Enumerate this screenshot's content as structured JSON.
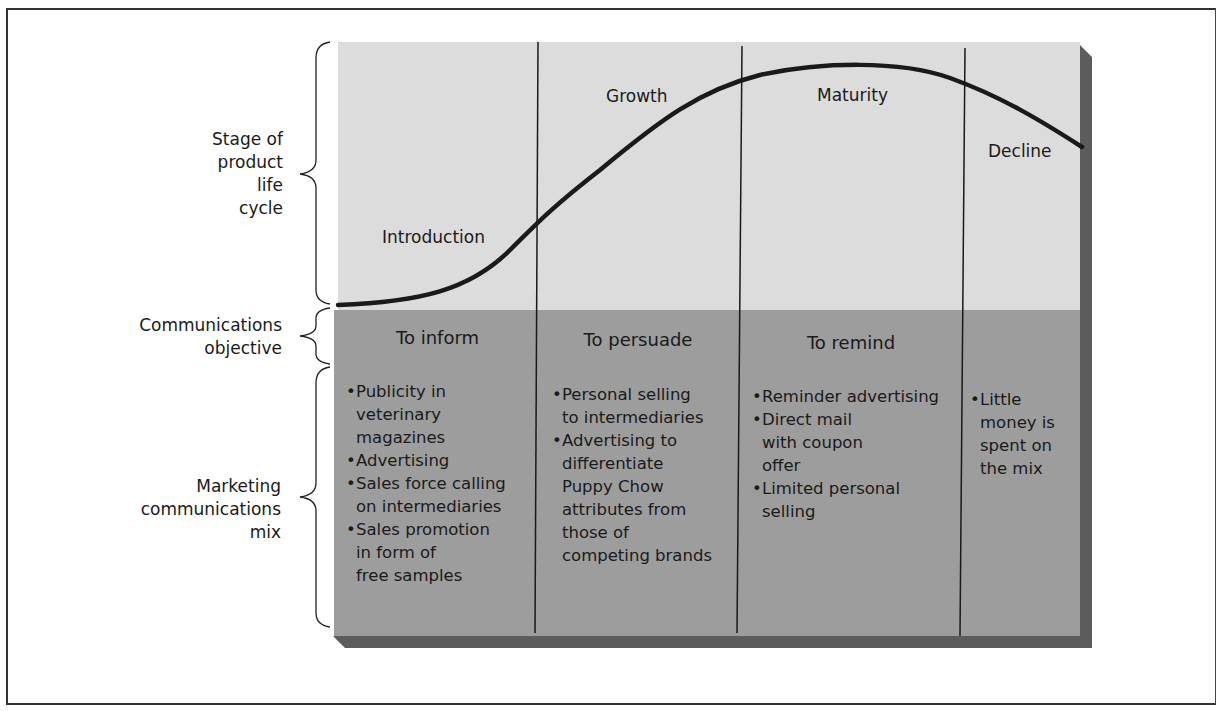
{
  "row_labels": {
    "stage": [
      "Stage of",
      "product",
      "life",
      "cycle"
    ],
    "objective": [
      "Communications",
      "objective"
    ],
    "mix": [
      "Marketing",
      "communications",
      "mix"
    ]
  },
  "stages": [
    {
      "name": "Introduction",
      "objective": "To inform",
      "mix": [
        "Publicity in veterinary magazines",
        "Advertising",
        "Sales force calling on intermediaries",
        "Sales promotion in form of free samples"
      ]
    },
    {
      "name": "Growth",
      "objective": "To persuade",
      "mix": [
        "Personal selling to intermediaries",
        "Advertising to differentiate Puppy Chow attributes from those of competing brands"
      ]
    },
    {
      "name": "Maturity",
      "objective": "To remind",
      "mix": [
        "Reminder advertising",
        "Direct mail with coupon offer",
        "Limited personal selling"
      ]
    },
    {
      "name": "Decline",
      "objective": "",
      "mix": [
        "Little money is spent on the mix"
      ]
    }
  ],
  "mix_lines": {
    "introduction": [
      [
        "Publicity in",
        "veterinary",
        "magazines"
      ],
      [
        "Advertising"
      ],
      [
        "Sales force calling",
        "on intermediaries"
      ],
      [
        "Sales promotion",
        "in form of",
        "free samples"
      ]
    ],
    "growth": [
      [
        "Personal selling",
        "to intermediaries"
      ],
      [
        "Advertising to",
        "differentiate",
        "Puppy Chow",
        "attributes from",
        "those of",
        "competing brands"
      ]
    ],
    "maturity": [
      [
        "Reminder advertising"
      ],
      [
        "Direct mail",
        "with coupon",
        "offer"
      ],
      [
        "Limited personal",
        "selling"
      ]
    ],
    "decline": [
      [
        "Little",
        "money is",
        "spent on",
        "the mix"
      ]
    ]
  },
  "colors": {
    "top_panel": "#dcdcdc",
    "bottom_panel": "#9e9e9e",
    "shadow": "#5a5a5a",
    "curve": "#1a1a1a",
    "divider": "#1a1a1a"
  }
}
